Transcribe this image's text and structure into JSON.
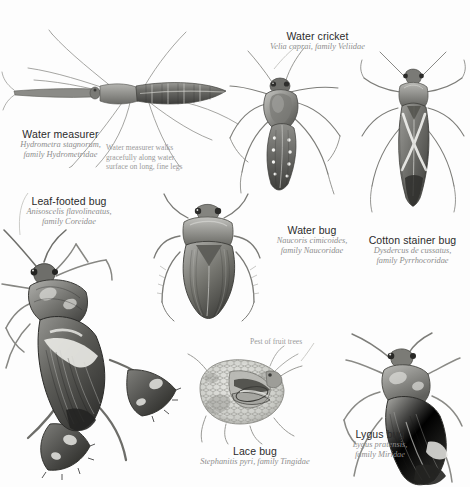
{
  "plate": {
    "title": "True bugs (Hemiptera) illustration plate",
    "background_color": "#fdfdfd",
    "ink_color": "#4a4a4a",
    "caption_name_color": "#2b2b2b",
    "caption_sci_color": "#8d8d8d"
  },
  "specimens": [
    {
      "id": "water-measurer",
      "common_name": "Water measurer",
      "scientific_name": "Hydrometra stagnorum,",
      "family": "family Hydrometridae",
      "note": "Water measurer walks\ngracefully along water\nsurface on long, fine legs",
      "note_line1": "Water measurer walks",
      "note_line2": "gracefully along water",
      "note_line3": "surface on long, fine legs"
    },
    {
      "id": "water-cricket",
      "common_name": "Water cricket",
      "scientific_name": "Velia caprai, family Veliidae",
      "family": ""
    },
    {
      "id": "cotton-stainer-bug",
      "common_name": "Cotton stainer bug",
      "scientific_name": "Dysdercus de cussatus,",
      "family": "family Pyrrhocoridae"
    },
    {
      "id": "leaf-footed-bug",
      "common_name": "Leaf-footed bug",
      "scientific_name": "Anisoscelis flavolineatus,",
      "family": "family Coreidae"
    },
    {
      "id": "water-bug",
      "common_name": "Water bug",
      "scientific_name": "Naucoris cimicoides,",
      "family": "family Naucoridae"
    },
    {
      "id": "lace-bug",
      "common_name": "Lace bug",
      "scientific_name": "Stephanitis pyri, family Tingidae",
      "family": "",
      "note_line1": "Pest of fruit trees"
    },
    {
      "id": "lygus-bug",
      "common_name": "Lygus bug",
      "scientific_name": "Lygus pratensis,",
      "family": "family Miridae"
    }
  ]
}
